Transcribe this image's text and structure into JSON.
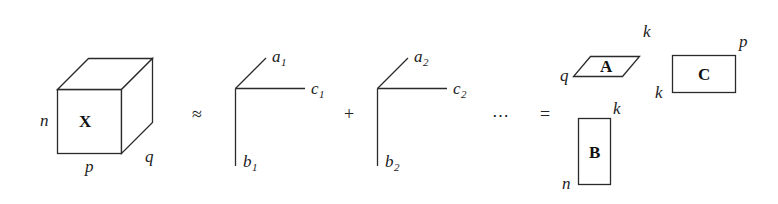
{
  "figure": {
    "stroke_color": "#2a2a2a",
    "text_color": "#1b1b1b",
    "background_color": "#ffffff"
  },
  "tensor": {
    "name": "X",
    "dim_left": "n",
    "dim_bottom": "p",
    "dim_depth": "q"
  },
  "operators": {
    "approx": "≈",
    "plus": "+",
    "ellipsis": "⋯",
    "equals": "="
  },
  "rank_one_terms": [
    {
      "mode_a": "a",
      "mode_a_index": "1",
      "mode_b": "b",
      "mode_b_index": "1",
      "mode_c": "c",
      "mode_c_index": "1"
    },
    {
      "mode_a": "a",
      "mode_a_index": "2",
      "mode_b": "b",
      "mode_b_index": "2",
      "mode_c": "c",
      "mode_c_index": "2"
    }
  ],
  "factor_matrices": [
    {
      "name": "A",
      "shape": "parallelogram",
      "dim_left": "q",
      "dim_top": "k"
    },
    {
      "name": "B",
      "shape": "rectangle-tall",
      "dim_bottom_left": "n",
      "dim_top_right": "k"
    },
    {
      "name": "C",
      "shape": "rectangle-wide",
      "dim_left": "k",
      "dim_top_right": "p"
    }
  ]
}
